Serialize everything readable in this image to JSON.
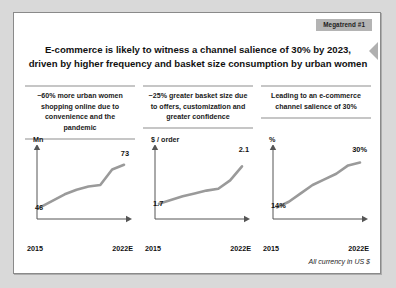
{
  "badge": {
    "label": "Megatrend #1",
    "bg_color": "#b4b4b4"
  },
  "headline": {
    "line1": "E-commerce is likely to witness a channel salience of 30% by 2023,",
    "line2": "driven by higher frequency and basket size consumption by urban women"
  },
  "columns": [
    {
      "heading": "~60% more urban women shopping online due to convenience and the pandemic"
    },
    {
      "heading": "~25% greater basket size due to offers, customization and greater confidence"
    },
    {
      "heading": "Leading to an e-commerce channel salience of 30%"
    }
  ],
  "footnote": "All currency in US $",
  "chart_data": [
    {
      "type": "line",
      "title": "",
      "ylabel": "Mn",
      "xlabel": "",
      "categories": [
        "2015",
        "2016",
        "2017",
        "2018",
        "2019",
        "2020",
        "2021",
        "2022E"
      ],
      "x_tick_labels": [
        "2015",
        "2022E"
      ],
      "values": [
        46,
        50,
        54,
        57,
        59,
        60,
        70,
        73
      ],
      "start_label": "46",
      "end_label": "73",
      "ylim": [
        42,
        78
      ],
      "grid": false,
      "line_color": "#9a9a9a"
    },
    {
      "type": "line",
      "title": "",
      "ylabel": "$ / order",
      "xlabel": "",
      "categories": [
        "2015",
        "2016",
        "2017",
        "2018",
        "2019",
        "2020",
        "2021",
        "2022E"
      ],
      "x_tick_labels": [
        "2015",
        "2022E"
      ],
      "values": [
        1.7,
        1.74,
        1.78,
        1.81,
        1.84,
        1.86,
        1.95,
        2.1
      ],
      "start_label": "1.7",
      "end_label": "2.1",
      "ylim": [
        1.6,
        2.2
      ],
      "grid": false,
      "line_color": "#9a9a9a"
    },
    {
      "type": "line",
      "title": "",
      "ylabel": "%",
      "xlabel": "",
      "categories": [
        "2015",
        "2016",
        "2017",
        "2018",
        "2019",
        "2020",
        "2021",
        "2022E"
      ],
      "x_tick_labels": [
        "2015",
        "2022E"
      ],
      "values": [
        14,
        16,
        19,
        22,
        24,
        26,
        29,
        30
      ],
      "start_label": "14%",
      "end_label": "30%",
      "ylim": [
        12,
        32
      ],
      "grid": false,
      "line_color": "#9a9a9a"
    }
  ]
}
